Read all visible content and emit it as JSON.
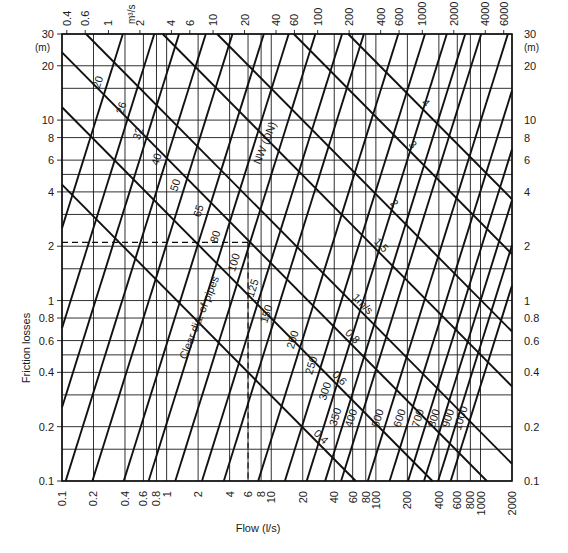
{
  "chart_data": {
    "type": "line",
    "title": "",
    "xlabel": "Flow (l/s)",
    "ylabel": "Friction losses",
    "y_unit_label": "(m)",
    "top_axis_unit": "m³/s",
    "xscale": "log",
    "yscale": "log",
    "xlim": [
      0.1,
      2000
    ],
    "ylim": [
      0.1,
      30
    ],
    "grid": true,
    "x_ticks_bottom": [
      "0.1",
      "0.2",
      "0.4",
      "0.6",
      "0.8",
      "1",
      "2",
      "4",
      "6",
      "8",
      "10",
      "20",
      "40",
      "60",
      "80",
      "100",
      "200",
      "400",
      "600",
      "800",
      "1000",
      "2000"
    ],
    "x_tick_values_bottom": [
      0.1,
      0.2,
      0.4,
      0.6,
      0.8,
      1,
      2,
      4,
      6,
      8,
      10,
      20,
      40,
      60,
      80,
      100,
      200,
      400,
      600,
      800,
      1000,
      2000
    ],
    "x_ticks_top": [
      "0.4",
      "0.6",
      "1",
      "2",
      "4",
      "6",
      "10",
      "20",
      "40",
      "60",
      "100",
      "200",
      "400",
      "600",
      "1000",
      "2000",
      "4000",
      "6000"
    ],
    "x_tick_values_top": [
      0.4,
      0.6,
      1,
      2,
      4,
      6,
      10,
      20,
      40,
      60,
      100,
      200,
      400,
      600,
      1000,
      2000,
      4000,
      6000
    ],
    "y_ticks": [
      "0.1",
      "0.2",
      "0.4",
      "0.6",
      "0.8",
      "1",
      "2",
      "4",
      "6",
      "8",
      "10",
      "20",
      "30"
    ],
    "y_tick_values": [
      0.1,
      0.2,
      0.4,
      0.6,
      0.8,
      1,
      2,
      4,
      6,
      8,
      10,
      20,
      30
    ],
    "pipe_series_title": "NW (DN)",
    "pipe_series_axis_note": "Clear dia. of pipes",
    "pipe_diameters": [
      {
        "name": "20",
        "dn_mm": 20
      },
      {
        "name": "26",
        "dn_mm": 26
      },
      {
        "name": "32",
        "dn_mm": 32
      },
      {
        "name": "40",
        "dn_mm": 40
      },
      {
        "name": "50",
        "dn_mm": 50
      },
      {
        "name": "65",
        "dn_mm": 65
      },
      {
        "name": "80",
        "dn_mm": 80
      },
      {
        "name": "100",
        "dn_mm": 100
      },
      {
        "name": "125",
        "dn_mm": 125
      },
      {
        "name": "150",
        "dn_mm": 150
      },
      {
        "name": "200",
        "dn_mm": 200
      },
      {
        "name": "250",
        "dn_mm": 250
      },
      {
        "name": "300",
        "dn_mm": 300
      },
      {
        "name": "350",
        "dn_mm": 350
      },
      {
        "name": "400",
        "dn_mm": 400
      },
      {
        "name": "500",
        "dn_mm": 500
      },
      {
        "name": "600",
        "dn_mm": 600
      },
      {
        "name": "700",
        "dn_mm": 700
      },
      {
        "name": "800",
        "dn_mm": 800
      },
      {
        "name": "900",
        "dn_mm": 900
      },
      {
        "name": "1000",
        "dn_mm": 1000
      }
    ],
    "velocity_lines": [
      {
        "name": "0.4",
        "v_ms": 0.4
      },
      {
        "name": "0.6",
        "v_ms": 0.6
      },
      {
        "name": "0.8",
        "v_ms": 0.8
      },
      {
        "name": "1m/s",
        "v_ms": 1.0
      },
      {
        "name": "1.5",
        "v_ms": 1.5
      },
      {
        "name": "2",
        "v_ms": 2
      },
      {
        "name": "3",
        "v_ms": 3
      },
      {
        "name": "4",
        "v_ms": 4
      }
    ],
    "example_reading": {
      "flow_ls": 6,
      "friction_loss_m": 2.1
    },
    "annotations": [
      "NW (DN)",
      "Clear dia. of pipes"
    ]
  },
  "labels": {
    "xlabel": "Flow (l/s)",
    "ylabel": "Friction losses",
    "y_unit_left": "(m)",
    "y_unit_right": "(m)",
    "top_unit": "m³/s",
    "nw_label": "NW (DN)",
    "clear_dia_label": "Clear dia. of pipes"
  }
}
